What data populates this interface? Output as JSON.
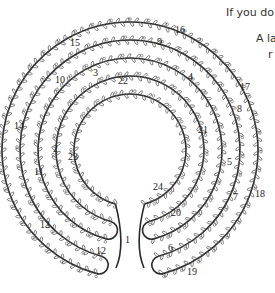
{
  "captions": [
    {
      "text": "If you do",
      "x": 226,
      "y": 6
    },
    {
      "text": "A la",
      "x": 256,
      "y": 32
    },
    {
      "text": "r",
      "x": 268,
      "y": 48
    }
  ],
  "labyrinth": {
    "center_x": 130,
    "center_y": 150,
    "rings": [
      {
        "r": 128,
        "label": "outer-ring"
      },
      {
        "r": 110,
        "label": "ring-2"
      },
      {
        "r": 92,
        "label": "ring-3"
      },
      {
        "r": 74,
        "label": "ring-4"
      },
      {
        "r": 56,
        "label": "inner-ring"
      }
    ],
    "vine_color": "#2a2a2a",
    "leaf_color": "#555555",
    "numbers": [
      {
        "n": "1",
        "x": 125,
        "y": 243
      },
      {
        "n": "2",
        "x": 53,
        "y": 152
      },
      {
        "n": "3",
        "x": 93,
        "y": 76
      },
      {
        "n": "4",
        "x": 188,
        "y": 80
      },
      {
        "n": "5",
        "x": 227,
        "y": 165
      },
      {
        "n": "6",
        "x": 168,
        "y": 251
      },
      {
        "n": "7",
        "x": 233,
        "y": 200
      },
      {
        "n": "8",
        "x": 237,
        "y": 112
      },
      {
        "n": "9",
        "x": 157,
        "y": 45
      },
      {
        "n": "10",
        "x": 55,
        "y": 83
      },
      {
        "n": "11",
        "x": 34,
        "y": 175
      },
      {
        "n": "12",
        "x": 96,
        "y": 254
      },
      {
        "n": "13",
        "x": 40,
        "y": 228
      },
      {
        "n": "14",
        "x": 14,
        "y": 129
      },
      {
        "n": "15",
        "x": 70,
        "y": 46
      },
      {
        "n": "16",
        "x": 175,
        "y": 33
      },
      {
        "n": "17",
        "x": 240,
        "y": 90
      },
      {
        "n": "18",
        "x": 255,
        "y": 197
      },
      {
        "n": "19",
        "x": 187,
        "y": 275
      },
      {
        "n": "20",
        "x": 171,
        "y": 216
      },
      {
        "n": "21",
        "x": 198,
        "y": 133
      },
      {
        "n": "22",
        "x": 118,
        "y": 84
      },
      {
        "n": "23",
        "x": 68,
        "y": 160
      },
      {
        "n": "24",
        "x": 153,
        "y": 190
      }
    ]
  }
}
